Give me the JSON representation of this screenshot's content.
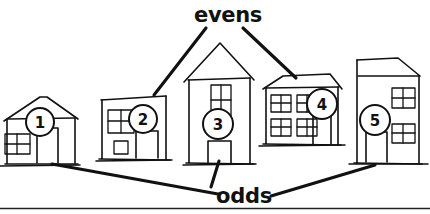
{
  "figure": {
    "background_color": "#ffffff",
    "ink_color": "#111111",
    "width": 430,
    "height": 214
  },
  "annotations": {
    "evens": {
      "label": "evens",
      "x": 228,
      "y": 15,
      "points_to": [
        "house-2",
        "house-4"
      ]
    },
    "odds": {
      "label": "odds",
      "x": 244,
      "y": 196,
      "points_to": [
        "house-1",
        "house-3",
        "house-5"
      ]
    }
  },
  "houses": [
    {
      "id": "house-1",
      "number": "1",
      "parity": "odd",
      "badge_x": 40,
      "badge_y": 122,
      "badge_r": 14,
      "style": "gabled-cottage",
      "windows": 1,
      "doors": 1
    },
    {
      "id": "house-2",
      "number": "2",
      "parity": "even",
      "badge_x": 143,
      "badge_y": 119,
      "badge_r": 14,
      "style": "flat-top-box",
      "windows": 2,
      "doors": 1
    },
    {
      "id": "house-3",
      "number": "3",
      "parity": "odd",
      "badge_x": 218,
      "badge_y": 124,
      "badge_r": 15,
      "style": "tall-gabled",
      "windows": 1,
      "doors": 1
    },
    {
      "id": "house-4",
      "number": "4",
      "parity": "even",
      "badge_x": 322,
      "badge_y": 104,
      "badge_r": 15,
      "style": "wide-hipped",
      "windows": 4,
      "doors": 1
    },
    {
      "id": "house-5",
      "number": "5",
      "parity": "odd",
      "badge_x": 375,
      "badge_y": 120,
      "badge_r": 15,
      "style": "tall-slant-roof",
      "windows": 2,
      "doors": 1
    }
  ],
  "footer": {
    "rule": "horizontal-divider"
  }
}
